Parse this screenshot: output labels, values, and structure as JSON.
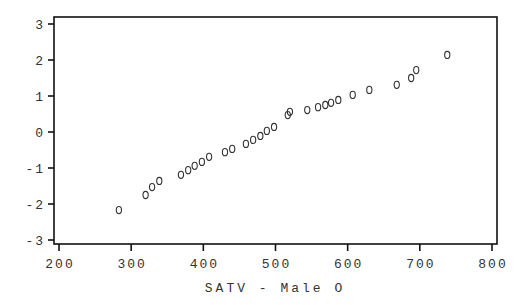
{
  "chart_data": {
    "type": "scatter",
    "title": "",
    "xlabel": "SATV - Male O",
    "ylabel": "",
    "xlim": [
      200,
      800
    ],
    "ylim": [
      -3,
      3
    ],
    "xticks": [
      200,
      300,
      400,
      500,
      600,
      700,
      800
    ],
    "yticks": [
      3,
      2,
      1,
      0,
      -1,
      -2,
      -3
    ],
    "xtick_labels": [
      "200",
      "300",
      "400",
      "500",
      "600",
      "700",
      "800"
    ],
    "ytick_labels": [
      "3",
      "2",
      "1",
      "0",
      "-1",
      "-2",
      "-3"
    ],
    "grid": false,
    "legend": null,
    "marker": "O",
    "series": [
      {
        "name": "Male",
        "points": [
          {
            "x": 283,
            "y": -2.17
          },
          {
            "x": 320,
            "y": -1.75
          },
          {
            "x": 329,
            "y": -1.53
          },
          {
            "x": 339,
            "y": -1.36
          },
          {
            "x": 369,
            "y": -1.19
          },
          {
            "x": 379,
            "y": -1.06
          },
          {
            "x": 388,
            "y": -0.94
          },
          {
            "x": 398,
            "y": -0.83
          },
          {
            "x": 408,
            "y": -0.69
          },
          {
            "x": 430,
            "y": -0.56
          },
          {
            "x": 440,
            "y": -0.47
          },
          {
            "x": 459,
            "y": -0.33
          },
          {
            "x": 469,
            "y": -0.22
          },
          {
            "x": 479,
            "y": -0.11
          },
          {
            "x": 488,
            "y": 0.03
          },
          {
            "x": 498,
            "y": 0.14
          },
          {
            "x": 517,
            "y": 0.47
          },
          {
            "x": 520,
            "y": 0.56
          },
          {
            "x": 544,
            "y": 0.61
          },
          {
            "x": 559,
            "y": 0.69
          },
          {
            "x": 569,
            "y": 0.75
          },
          {
            "x": 577,
            "y": 0.81
          },
          {
            "x": 587,
            "y": 0.89
          },
          {
            "x": 607,
            "y": 1.03
          },
          {
            "x": 630,
            "y": 1.17
          },
          {
            "x": 668,
            "y": 1.31
          },
          {
            "x": 688,
            "y": 1.5
          },
          {
            "x": 695,
            "y": 1.72
          },
          {
            "x": 738,
            "y": 2.14
          }
        ]
      }
    ]
  },
  "colors": {
    "frame": "#111111",
    "text": "#333333",
    "marker": "#333333",
    "background": "#ffffff"
  }
}
